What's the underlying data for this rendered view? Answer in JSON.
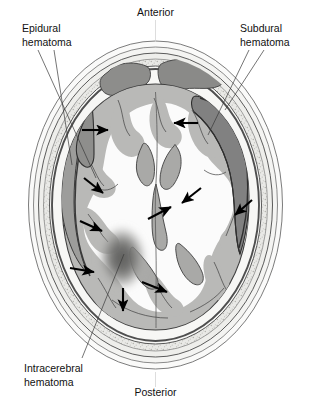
{
  "figure": {
    "width": 311,
    "height": 407,
    "background": "#ffffff"
  },
  "orientation_labels": {
    "anterior": "Anterior",
    "posterior": "Posterior"
  },
  "annotations": [
    {
      "id": "epidural",
      "label_line1": "Epidural",
      "label_line2": "hematoma",
      "text_x": 22,
      "text_y": 30,
      "leaders": [
        {
          "x1": 38,
          "y1": 48,
          "x2": 92,
          "y2": 170
        },
        {
          "x1": 50,
          "y1": 48,
          "x2": 70,
          "y2": 160
        }
      ]
    },
    {
      "id": "subdural",
      "label_line1": "Subdural",
      "label_line2": "hematoma",
      "text_x": 240,
      "text_y": 30,
      "leaders": [
        {
          "x1": 250,
          "y1": 48,
          "x2": 212,
          "y2": 132
        },
        {
          "x1": 262,
          "y1": 48,
          "x2": 228,
          "y2": 112
        }
      ]
    },
    {
      "id": "intracerebral",
      "label_line1": "Intracerebral",
      "label_line2": "hematoma",
      "text_x": 24,
      "text_y": 372,
      "leaders": [
        {
          "x1": 80,
          "y1": 362,
          "x2": 122,
          "y2": 258
        }
      ]
    }
  ],
  "colors": {
    "scalp_outer": "#f2f2f0",
    "scalp_inner": "#e8e8e6",
    "skull_bone": "#e4e4e1",
    "diploe_speckle": "#b9b9b4",
    "dura": "#555555",
    "brain_gray_matter": "#b9b9b7",
    "brain_white_matter": "#fbfbfb",
    "ventricle": "#a9a9a7",
    "sinus": "#8c8c8a",
    "subdural_blood": "#808080",
    "epidural_blood": "#9a9a98",
    "intracerebral_blood": "#6e6e6c",
    "outline": "#4a4a4a",
    "sulcus_line": "#3c3c3c",
    "arrow": "#000000",
    "leader": "#3a3a3a",
    "text": "#111111"
  },
  "structures": {
    "skull": "oval cranial vault with scalp, outer table, diploe and inner table",
    "frontal_sinuses": "two dark gray lobulated air cavities at anterior midline",
    "ventricles": "compressed, midline-shifted lateral ventricles",
    "falx": "midline interhemispheric fissure",
    "gyri": "cortical gyral folds of gray matter surrounding white matter"
  },
  "mass_effect_arrows": {
    "description": "Black arrows indicate direction of mass effect / brain tissue displacement",
    "count": 10,
    "arrows": [
      {
        "id": "arrow-left-frontal-right",
        "x1": 82,
        "y1": 130,
        "x2": 110,
        "y2": 130
      },
      {
        "id": "arrow-right-frontal-left",
        "x1": 196,
        "y1": 123,
        "x2": 172,
        "y2": 123
      },
      {
        "id": "arrow-left-upper-inward",
        "x1": 84,
        "y1": 178,
        "x2": 104,
        "y2": 194
      },
      {
        "id": "arrow-right-mid-inward",
        "x1": 200,
        "y1": 188,
        "x2": 180,
        "y2": 204
      },
      {
        "id": "arrow-left-mid-inward",
        "x1": 82,
        "y1": 222,
        "x2": 104,
        "y2": 232
      },
      {
        "id": "arrow-right-lower-inward",
        "x1": 252,
        "y1": 200,
        "x2": 234,
        "y2": 216
      },
      {
        "id": "arrow-left-low-inward",
        "x1": 72,
        "y1": 268,
        "x2": 95,
        "y2": 272
      },
      {
        "id": "arrow-center-up-right",
        "x1": 148,
        "y1": 218,
        "x2": 172,
        "y2": 206
      },
      {
        "id": "arrow-hematoma-right",
        "x1": 142,
        "y1": 282,
        "x2": 168,
        "y2": 292
      },
      {
        "id": "arrow-hematoma-down",
        "x1": 123,
        "y1": 288,
        "x2": 123,
        "y2": 312
      }
    ]
  },
  "lesions": [
    {
      "id": "epidural-hematoma",
      "name": "Epidural hematoma",
      "side": "left",
      "shape": "biconvex / lentiform collection between skull and dura",
      "fill": "#9a9a98"
    },
    {
      "id": "subdural-hematoma",
      "name": "Subdural hematoma",
      "side": "right",
      "shape": "crescent-shaped collection beneath dura following inner skull contour",
      "fill": "#808080"
    },
    {
      "id": "intracerebral-hematoma",
      "name": "Intracerebral hematoma",
      "side": "left",
      "shape": "diffuse blurred oval within brain parenchyma",
      "fill": "#6e6e6c"
    }
  ]
}
